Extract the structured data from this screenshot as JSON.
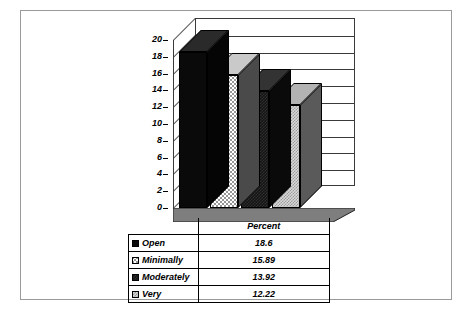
{
  "chart_data": {
    "type": "bar",
    "title": "",
    "subtitle": "",
    "xlabel": "",
    "ylabel": "",
    "categories": [
      "Open",
      "Minimally",
      "Moderately",
      "Very"
    ],
    "values": [
      18.6,
      15.89,
      13.92,
      12.22
    ],
    "series_name": "Percent",
    "ylim": [
      0,
      20
    ],
    "ytick_step": 2,
    "yticks": [
      "20",
      "18",
      "16",
      "14",
      "12",
      "10",
      "8",
      "6",
      "4",
      "2",
      "0"
    ],
    "grid": true,
    "legend_position": "table-below",
    "style": "3d-column",
    "bar_fills": [
      "black-dots",
      "white-dots",
      "solid-dark",
      "gray-check"
    ]
  },
  "table": {
    "header_value_label": "Percent",
    "rows": [
      {
        "category": "Open",
        "value": "18.6",
        "swatch": "black-dots"
      },
      {
        "category": "Minimally",
        "value": "15.89",
        "swatch": "white-dots"
      },
      {
        "category": "Moderately",
        "value": "13.92",
        "swatch": "solid-dark"
      },
      {
        "category": "Very",
        "value": "12.22",
        "swatch": "gray-check"
      }
    ]
  },
  "colors": {
    "axis": "#3a3a3a",
    "border": "#9a9a9a",
    "floor": "#7e7e7e",
    "floor_top": "#6e6e6e",
    "text": "#000000"
  }
}
